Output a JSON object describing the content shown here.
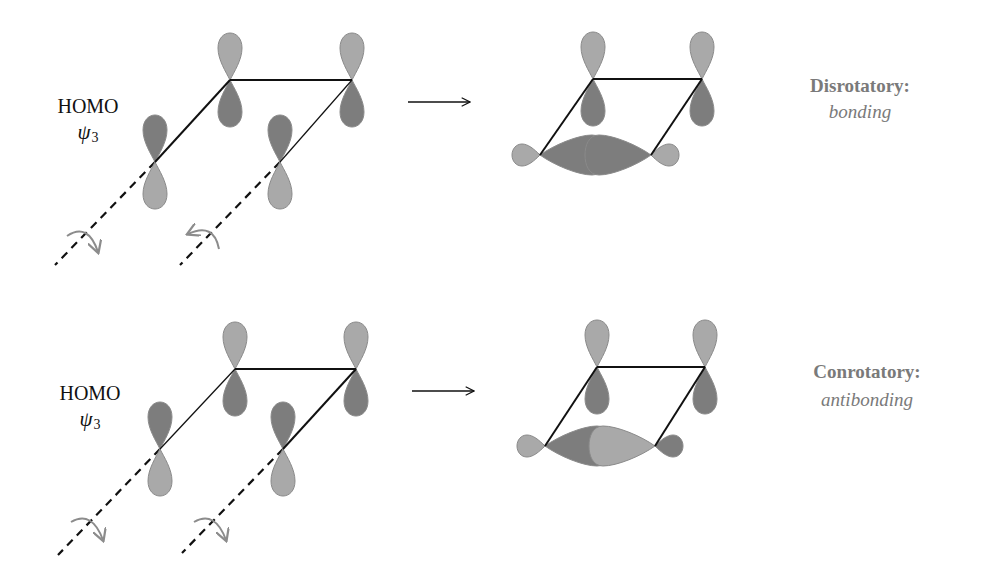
{
  "colors": {
    "light_lobe": "#a9a9a9",
    "dark_lobe": "#7d7d7d",
    "lobe_edge": "#8a8a8a",
    "bond": "#111111",
    "rotation_arrow": "#8c8c8c",
    "label_gray": "#7a7a7a"
  },
  "panels": [
    {
      "id": "disrotatory",
      "reactant": {
        "orbital_label": "HOMO",
        "wavefunction_symbol": "ψ",
        "wavefunction_subscript": "3",
        "rotation": [
          "clockwise",
          "counterclockwise"
        ]
      },
      "reaction_arrow": "→",
      "product": {
        "mode_label": "Disrotatory:",
        "interaction_label": "bonding"
      }
    },
    {
      "id": "conrotatory",
      "reactant": {
        "orbital_label": "HOMO",
        "wavefunction_symbol": "ψ",
        "wavefunction_subscript": "3",
        "rotation": [
          "clockwise",
          "clockwise"
        ]
      },
      "reaction_arrow": "→",
      "product": {
        "mode_label": "Conrotatory:",
        "interaction_label": "antibonding"
      }
    }
  ]
}
